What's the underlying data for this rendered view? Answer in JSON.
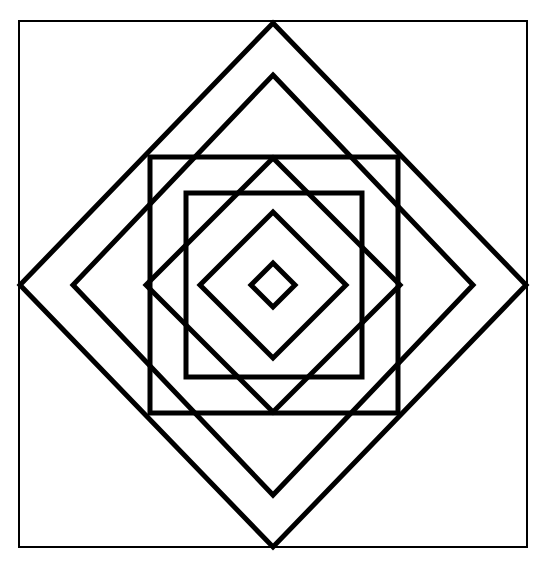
{
  "figure": {
    "stroke_color": "#000000",
    "background": "#ffffff",
    "frame": {
      "x": 19,
      "y": 21,
      "w": 508,
      "h": 526,
      "stroke_width": 2
    },
    "center": {
      "x": 273,
      "y": 285
    },
    "diamonds": [
      {
        "name": "outer-diamond",
        "half_w": 253,
        "half_h": 262,
        "stroke_width": 5
      },
      {
        "name": "second-diamond",
        "half_w": 200,
        "half_h": 210,
        "stroke_width": 5
      },
      {
        "name": "middle-diamond",
        "half_w": 127,
        "half_h": 127,
        "stroke_width": 5
      },
      {
        "name": "inner-diamond",
        "half_w": 73,
        "half_h": 73,
        "stroke_width": 5
      },
      {
        "name": "center-diamond",
        "half_w": 22,
        "half_h": 22,
        "stroke_width": 5
      }
    ],
    "squares": [
      {
        "name": "large-square",
        "x": 150,
        "y": 157,
        "w": 248,
        "h": 256,
        "stroke_width": 5
      },
      {
        "name": "inner-square",
        "x": 186,
        "y": 193,
        "w": 176,
        "h": 184,
        "stroke_width": 5
      }
    ]
  }
}
